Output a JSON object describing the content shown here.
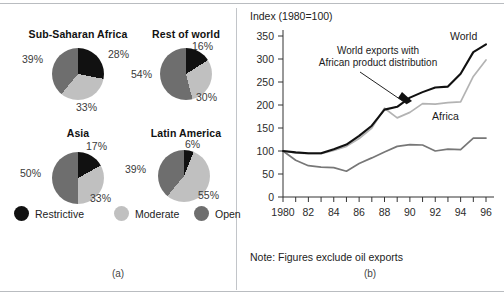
{
  "figure": {
    "panel_a_caption": "(a)",
    "panel_b_caption": "(b)"
  },
  "panel_a": {
    "legend": [
      {
        "label": "Restrictive",
        "color": "#111111"
      },
      {
        "label": "Moderate",
        "color": "#c0c0c0"
      },
      {
        "label": "Open",
        "color": "#6e6e6e"
      }
    ],
    "pies": [
      {
        "title": "Sub-Saharan Africa",
        "slices": [
          {
            "name": "Restrictive",
            "value": 28,
            "label": "28%"
          },
          {
            "name": "Moderate",
            "value": 33,
            "label": "33%"
          },
          {
            "name": "Open",
            "value": 39,
            "label": "39%"
          }
        ]
      },
      {
        "title": "Rest of world",
        "slices": [
          {
            "name": "Restrictive",
            "value": 16,
            "label": "16%"
          },
          {
            "name": "Moderate",
            "value": 30,
            "label": "30%"
          },
          {
            "name": "Open",
            "value": 54,
            "label": "54%"
          }
        ]
      },
      {
        "title": "Asia",
        "slices": [
          {
            "name": "Restrictive",
            "value": 17,
            "label": "17%"
          },
          {
            "name": "Moderate",
            "value": 33,
            "label": "33%"
          },
          {
            "name": "Open",
            "value": 50,
            "label": "50%"
          }
        ]
      },
      {
        "title": "Latin America",
        "slices": [
          {
            "name": "Restrictive",
            "value": 6,
            "label": "6%"
          },
          {
            "name": "Moderate",
            "value": 55,
            "label": "55%"
          },
          {
            "name": "Open",
            "value": 39,
            "label": "39%"
          }
        ]
      }
    ]
  },
  "panel_b": {
    "axis_caption": "Index (1980=100)",
    "note": "Note: Figures exclude oil exports",
    "labels": {
      "world": "World",
      "africa": "Africa",
      "annotation_line1": "World exports with",
      "annotation_line2": "African product distribution"
    }
  },
  "chart_data": [
    {
      "type": "pie",
      "title": "Sub-Saharan Africa",
      "categories": [
        "Restrictive",
        "Moderate",
        "Open"
      ],
      "values": [
        28,
        33,
        39
      ],
      "colors": [
        "#111111",
        "#c0c0c0",
        "#6e6e6e"
      ],
      "legend_position": "bottom"
    },
    {
      "type": "pie",
      "title": "Rest of world",
      "categories": [
        "Restrictive",
        "Moderate",
        "Open"
      ],
      "values": [
        16,
        30,
        54
      ],
      "colors": [
        "#111111",
        "#c0c0c0",
        "#6e6e6e"
      ],
      "legend_position": "bottom"
    },
    {
      "type": "pie",
      "title": "Asia",
      "categories": [
        "Restrictive",
        "Moderate",
        "Open"
      ],
      "values": [
        17,
        33,
        50
      ],
      "colors": [
        "#111111",
        "#c0c0c0",
        "#6e6e6e"
      ],
      "legend_position": "bottom"
    },
    {
      "type": "pie",
      "title": "Latin America",
      "categories": [
        "Restrictive",
        "Moderate",
        "Open"
      ],
      "values": [
        6,
        55,
        39
      ],
      "colors": [
        "#111111",
        "#c0c0c0",
        "#6e6e6e"
      ],
      "legend_position": "bottom"
    },
    {
      "type": "line",
      "title": "",
      "ylabel": "Index (1980=100)",
      "xlabel": "",
      "note": "Note: Figures exclude oil exports",
      "x": [
        1980,
        1981,
        1982,
        1983,
        1984,
        1985,
        1986,
        1987,
        1988,
        1989,
        1990,
        1991,
        1992,
        1993,
        1994,
        1995,
        1996
      ],
      "xtick_labels": [
        "1980",
        "",
        "82",
        "",
        "84",
        "",
        "86",
        "",
        "88",
        "",
        "90",
        "",
        "92",
        "",
        "94",
        "",
        "96"
      ],
      "ylim": [
        0,
        350
      ],
      "ytick_values": [
        0,
        50,
        100,
        150,
        200,
        250,
        300,
        350
      ],
      "grid": false,
      "legend_position": "inline-labels",
      "series": [
        {
          "name": "World",
          "color": "#111111",
          "values": [
            100,
            97,
            95,
            95,
            104,
            114,
            133,
            155,
            190,
            196,
            216,
            228,
            238,
            240,
            268,
            315,
            332
          ]
        },
        {
          "name": "World exports with African product distribution",
          "color": "#b3b3b3",
          "values": [
            100,
            96,
            94,
            94,
            101,
            110,
            127,
            150,
            193,
            172,
            184,
            203,
            202,
            205,
            207,
            262,
            298
          ]
        },
        {
          "name": "Africa",
          "color": "#777777",
          "values": [
            100,
            80,
            68,
            65,
            64,
            56,
            73,
            85,
            98,
            110,
            114,
            113,
            100,
            104,
            103,
            128,
            128
          ]
        }
      ]
    }
  ]
}
